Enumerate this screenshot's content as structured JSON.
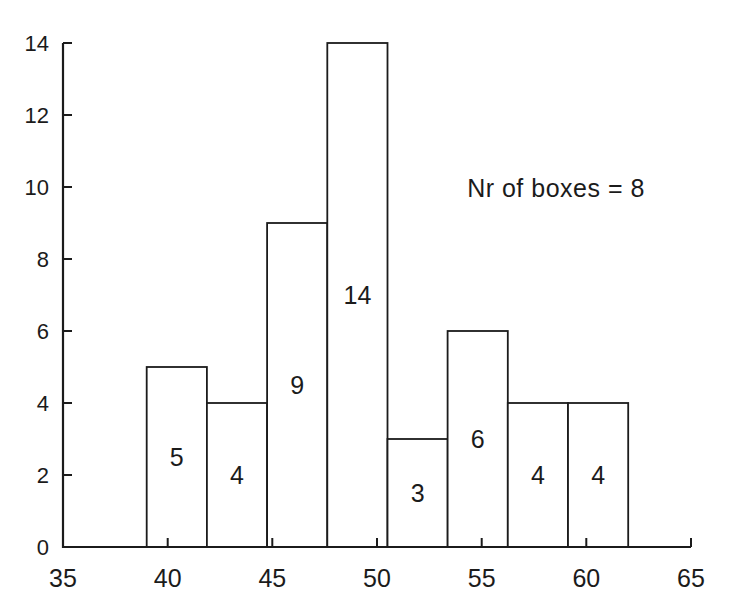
{
  "figure": {
    "background": "#ffffff",
    "ink_color": "#1b1b1b",
    "bar_fill": "#ffffff"
  },
  "chart_data": {
    "type": "bar",
    "subtype": "histogram",
    "title": "",
    "xlabel": "",
    "ylabel": "",
    "bin_edges": [
      39,
      41.875,
      44.75,
      47.625,
      50.5,
      53.375,
      56.25,
      59.125,
      62
    ],
    "counts": [
      5,
      4,
      9,
      14,
      3,
      6,
      4,
      4
    ],
    "bar_labels": [
      "5",
      "4",
      "9",
      "14",
      "3",
      "6",
      "4",
      "4"
    ],
    "x_ticks": [
      35,
      40,
      45,
      50,
      55,
      60,
      65
    ],
    "x_tick_labels": [
      "35",
      "40",
      "45",
      "50",
      "55",
      "60",
      "65"
    ],
    "y_ticks": [
      0,
      2,
      4,
      6,
      8,
      10,
      12,
      14
    ],
    "y_tick_labels": [
      "0",
      "2",
      "4",
      "6",
      "8",
      "10",
      "12",
      "14"
    ],
    "xlim": [
      35,
      65
    ],
    "ylim": [
      0,
      14
    ],
    "grid": false,
    "legend": null,
    "annotation": {
      "text": "Nr of boxes = 8",
      "x": 58.5,
      "y": 10
    }
  }
}
